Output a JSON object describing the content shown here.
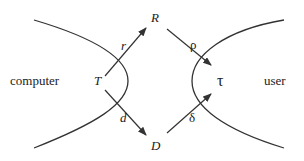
{
  "diagram": {
    "regions": {
      "left": "computer",
      "right": "user"
    },
    "nodes": {
      "T": "T",
      "R": "R",
      "D": "D",
      "tau": "τ"
    },
    "edges": [
      {
        "from": "T",
        "to": "R",
        "label": "r"
      },
      {
        "from": "R",
        "to": "tau",
        "label": "ρ"
      },
      {
        "from": "T",
        "to": "D",
        "label": "d"
      },
      {
        "from": "D",
        "to": "tau",
        "label": "δ"
      }
    ],
    "colors": {
      "stroke": "#333333",
      "text": "#222222"
    }
  }
}
